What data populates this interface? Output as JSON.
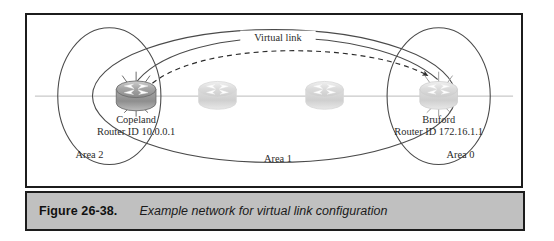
{
  "figure": {
    "caption_label": "Figure 26-38.",
    "caption_text": "Example network for virtual link configuration"
  },
  "diagram": {
    "type": "network-topology",
    "areas": [
      {
        "id": "area-2",
        "label": "Area 2",
        "shape": "ellipse",
        "orientation": "vertical"
      },
      {
        "id": "area-1",
        "label": "Area 1",
        "shape": "ellipse",
        "orientation": "horizontal"
      },
      {
        "id": "area-0",
        "label": "Area 0",
        "shape": "ellipse",
        "orientation": "vertical"
      }
    ],
    "routers": [
      {
        "id": "copeland",
        "name": "Copeland",
        "router_id": "Router ID 10.0.0.1",
        "state": "highlighted"
      },
      {
        "id": "transit-router-1",
        "name": "",
        "router_id": "",
        "state": "faded"
      },
      {
        "id": "transit-router-2",
        "name": "",
        "router_id": "",
        "state": "faded"
      },
      {
        "id": "bruford",
        "name": "Bruford",
        "router_id": "Router ID 172.16.1.1",
        "state": "faded"
      }
    ],
    "virtual_link": {
      "label": "Virtual link",
      "style": "dashed",
      "from": "copeland",
      "to": "bruford",
      "arrowhead": "bruford"
    },
    "colors": {
      "frame_border": "#1c1c1c",
      "caption_background": "#c0c0c0",
      "ellipse_stroke": "#3a3a3a",
      "router_highlight": "#9a9a9a",
      "router_faded": "#d2d2d2",
      "backbone_line": "#c8c8c8",
      "text": "#2b2b2b"
    }
  }
}
